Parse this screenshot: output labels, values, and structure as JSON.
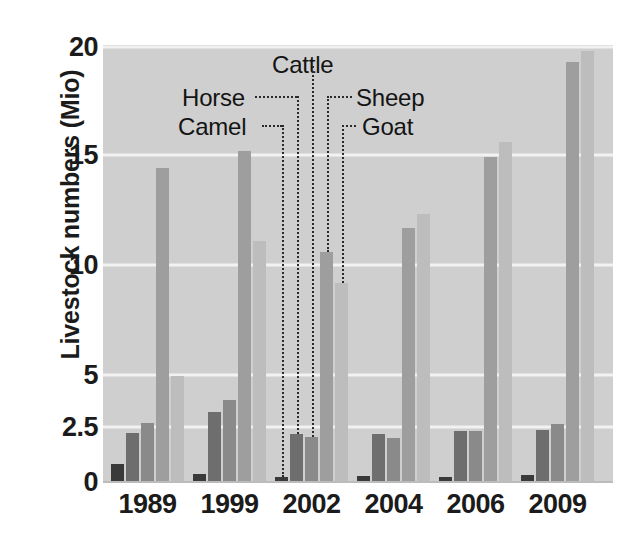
{
  "chart_data": {
    "type": "bar",
    "title": "",
    "xlabel": "",
    "ylabel": "Livestock numbers (Mio)",
    "categories": [
      "1989",
      "1999",
      "2002",
      "2004",
      "2006",
      "2009"
    ],
    "ytick_labels": [
      "0",
      "2.5",
      "5",
      "10",
      "15",
      "20"
    ],
    "ytick_values": [
      0,
      2.5,
      5,
      10,
      15,
      20
    ],
    "ylim": [
      0,
      20
    ],
    "y_axis_note": "non-linear spacing: extra tick at 2.5",
    "grid": "horizontal",
    "legend_position": "inside-plot-callouts",
    "series": [
      {
        "name": "Camel",
        "color": "#3a3a3a",
        "values": [
          0.8,
          0.35,
          0.25,
          0.26,
          0.25,
          0.3
        ]
      },
      {
        "name": "Horse",
        "color": "#6e6e6e",
        "values": [
          2.25,
          3.2,
          2.2,
          2.2,
          2.3,
          2.35
        ]
      },
      {
        "name": "Cattle",
        "color": "#8a8a8a",
        "values": [
          2.7,
          3.8,
          2.05,
          2.0,
          2.3,
          2.65
        ]
      },
      {
        "name": "Sheep",
        "color": "#9e9e9e",
        "values": [
          14.4,
          15.2,
          10.6,
          11.7,
          14.9,
          19.3
        ]
      },
      {
        "name": "Goat",
        "color": "#bdbdbd",
        "values": [
          4.95,
          11.1,
          9.2,
          12.3,
          15.6,
          19.8
        ]
      }
    ]
  },
  "callouts": {
    "cattle": "Cattle",
    "horse": "Horse",
    "sheep": "Sheep",
    "camel": "Camel",
    "goat": "Goat"
  },
  "colors": {
    "plot_background": "#cfcfcf",
    "gridline": "#f2f2f2",
    "text": "#1b1b1b",
    "page_background": "#ffffff"
  }
}
